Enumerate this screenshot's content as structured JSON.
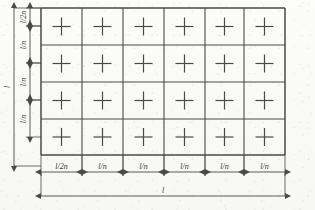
{
  "figure": {
    "name": "grid-slab-dimension-diagram",
    "background_color": "#fbfbfa",
    "line_color": "#4a4a4a",
    "text_color": "#3a3a3a",
    "grid": {
      "columns": 6,
      "rows": 4,
      "cell_marker": "cross",
      "x0": 41,
      "y0": 8,
      "x1": 285,
      "y1": 155,
      "col_edges": [
        41,
        82,
        123,
        164,
        205,
        244,
        285
      ],
      "row_edges": [
        8,
        45,
        82,
        119,
        155
      ]
    },
    "horizontal_dimensions": {
      "axis_y": 172,
      "segments": [
        {
          "label": "l/2n",
          "x_start": 41,
          "x_end": 82
        },
        {
          "label": "l/n",
          "x_start": 82,
          "x_end": 123
        },
        {
          "label": "l/n",
          "x_start": 123,
          "x_end": 164
        },
        {
          "label": "l/n",
          "x_start": 164,
          "x_end": 205
        },
        {
          "label": "l/n",
          "x_start": 205,
          "x_end": 244
        },
        {
          "label": "l/n",
          "x_start": 244,
          "x_end": 285
        }
      ],
      "overall": {
        "label": "l",
        "x_start": 41,
        "x_end": 285,
        "axis_y": 196
      }
    },
    "vertical_dimensions": {
      "axis_x": 30,
      "segments": [
        {
          "label": "l/2n",
          "y_start": 8,
          "y_end": 26
        },
        {
          "label": "l/n",
          "y_start": 26,
          "y_end": 63
        },
        {
          "label": "l/n",
          "y_start": 63,
          "y_end": 100
        },
        {
          "label": "l/n",
          "y_start": 100,
          "y_end": 137
        }
      ],
      "overall": {
        "label": "l",
        "y_start": 8,
        "y_end": 166,
        "axis_x": 14
      }
    }
  }
}
